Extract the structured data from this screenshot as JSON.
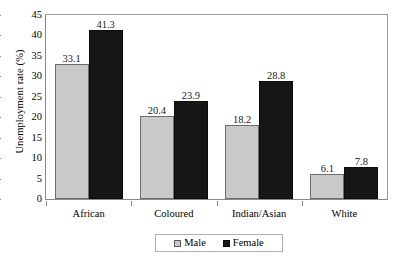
{
  "chart_data": {
    "type": "bar",
    "title": "",
    "xlabel": "",
    "ylabel": "Unemployment rate (%)",
    "ylim": [
      0,
      45
    ],
    "ytick_values": [
      45,
      40,
      35,
      30,
      25,
      20,
      15,
      10,
      5,
      0
    ],
    "ytick_labels": [
      "45",
      "40",
      "35",
      "30",
      "25",
      "20",
      "15",
      "10",
      "5",
      "0"
    ],
    "grid": false,
    "legend_position": "bottom-center",
    "categories": [
      "African",
      "Coloured",
      "Indian/Asian",
      "White"
    ],
    "series": [
      {
        "name": "Male",
        "color": "#c9c9c9",
        "values": [
          33.1,
          20.4,
          18.2,
          6.1
        ],
        "labels": [
          "33.1",
          "20.4",
          "18.2",
          "6.1"
        ]
      },
      {
        "name": "Female",
        "color": "#161616",
        "values": [
          41.3,
          23.9,
          28.8,
          7.8
        ],
        "labels": [
          "41.3",
          "23.9",
          "28.8",
          "7.8"
        ]
      }
    ]
  },
  "legend": {
    "items": [
      {
        "label": "Male",
        "swatch": "male"
      },
      {
        "label": "Female",
        "swatch": "female"
      }
    ]
  }
}
